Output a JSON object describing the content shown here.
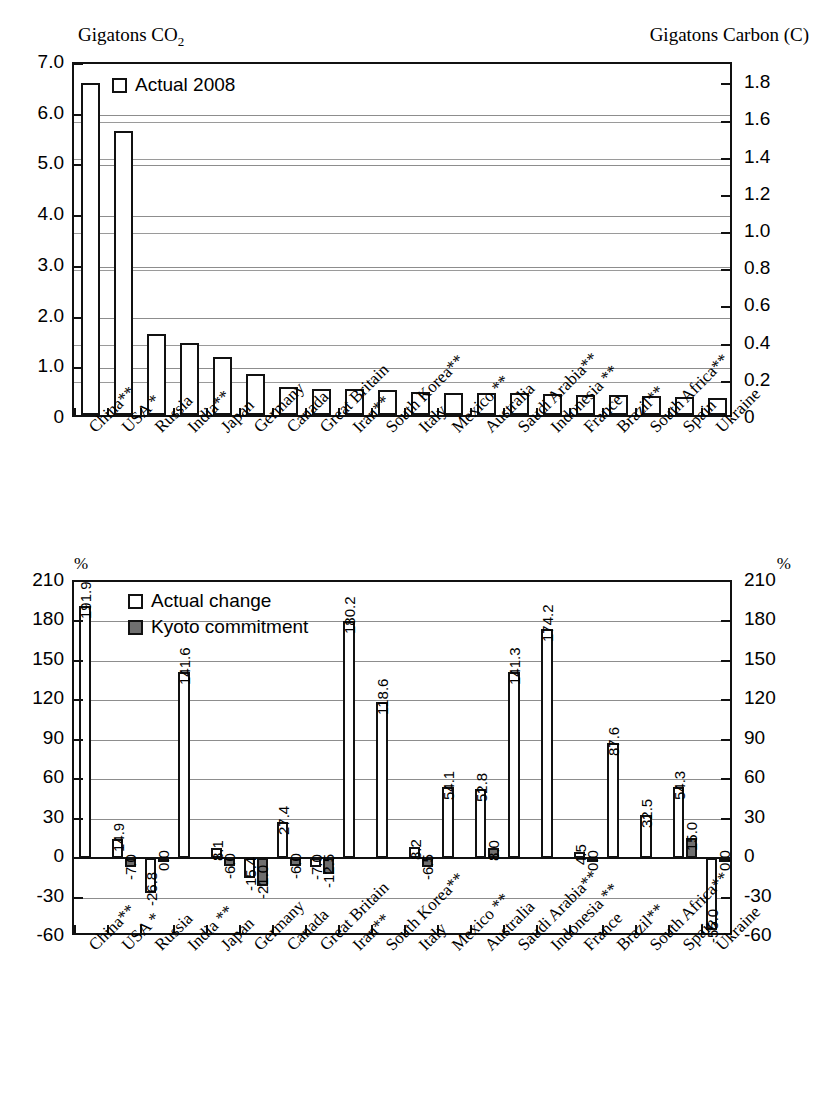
{
  "top_chart": {
    "left_axis_title": "Gigatons CO",
    "left_axis_title_sub": "2",
    "right_axis_title": "Gigatons Carbon (C)",
    "legend": [
      {
        "label": "Actual 2008",
        "style": "open"
      }
    ],
    "left_ticks": [
      "7.0",
      "6.0",
      "5.0",
      "4.0",
      "3.0",
      "2.0",
      "1.0",
      "0"
    ],
    "right_ticks": [
      "1.8",
      "1.6",
      "1.4",
      "1.2",
      "1.0",
      "0.8",
      "0.6",
      "0.4",
      "0.2",
      "0"
    ]
  },
  "bottom_chart": {
    "left_axis_title": "%",
    "right_axis_title": "%",
    "legend": [
      {
        "label": "Actual change",
        "style": "open"
      },
      {
        "label": "Kyoto commitment",
        "style": "filled"
      }
    ],
    "ticks": [
      "210",
      "180",
      "150",
      "120",
      "90",
      "60",
      "30",
      "0",
      "-30",
      "-60"
    ]
  },
  "chart_data": [
    {
      "type": "bar",
      "title": "Gigatons CO2",
      "xlabel": "",
      "ylabel": "Gigatons CO2",
      "ylabel_secondary": "Gigatons Carbon (C)",
      "ylim": [
        0,
        7.0
      ],
      "ylim_secondary": [
        0,
        1.909
      ],
      "grid": true,
      "legend_position": "top-left",
      "categories": [
        "China**",
        "USA *",
        "Russia",
        "India**",
        "Japan",
        "Germany",
        "Canada",
        "Great Britain",
        "Iran**",
        "South Korea**",
        "Italy",
        "Mexico **",
        "Australia",
        "Saudi Arabia**",
        "Indonesia **",
        "France",
        "Brazil**",
        "South Africa**",
        "Spain",
        "Ukraine"
      ],
      "series": [
        {
          "name": "Actual 2008",
          "values": [
            6.55,
            5.6,
            1.59,
            1.43,
            1.15,
            0.81,
            0.56,
            0.52,
            0.51,
            0.5,
            0.45,
            0.44,
            0.43,
            0.43,
            0.41,
            0.4,
            0.39,
            0.38,
            0.36,
            0.34
          ]
        }
      ]
    },
    {
      "type": "bar",
      "title": "",
      "xlabel": "",
      "ylabel": "%",
      "ylabel_secondary": "%",
      "ylim": [
        -60,
        210
      ],
      "grid": true,
      "legend_position": "top-left",
      "categories": [
        "China**",
        "USA *",
        "Russia",
        "India **",
        "Japan",
        "Germany",
        "Canada",
        "Great Britain",
        "Iran**",
        "South Korea**",
        "Italy",
        "Mexico **",
        "Australia",
        "Saudi Arabia**",
        "Indonesia **",
        "France",
        "Brazil**",
        "South Africa**",
        "Spain",
        "Ukraine"
      ],
      "series": [
        {
          "name": "Actual change",
          "values": [
            191.9,
            14.9,
            -26.8,
            141.6,
            8.1,
            -15.4,
            27.4,
            -7.0,
            180.2,
            118.6,
            8.2,
            54.1,
            52.8,
            141.3,
            174.2,
            4.5,
            87.6,
            32.5,
            54.3,
            -55.0
          ]
        },
        {
          "name": "Kyoto commitment",
          "values": [
            null,
            -7.0,
            0.0,
            null,
            -6.0,
            -21.0,
            -6.0,
            -12.5,
            null,
            null,
            -6.5,
            null,
            8.0,
            null,
            null,
            0.0,
            null,
            null,
            15.0,
            0.0
          ]
        }
      ],
      "labels": {
        "actual": [
          "191.9",
          "14.9",
          "-26.8",
          "141.6",
          "8.1",
          "-15.4",
          "27.4",
          "-7.0",
          "180.2",
          "118.6",
          "8.2",
          "54.1",
          "52.8",
          "141.3",
          "174.2",
          "4.5",
          "87.6",
          "32.5",
          "54.3",
          "-55.0"
        ],
        "kyoto": [
          "",
          "-7.0",
          "0.0",
          "",
          "-6.0",
          "-21.0",
          "-6.0",
          "-12.5",
          "",
          "",
          "-6.5",
          "",
          "8.0",
          "",
          "",
          "0.0",
          "",
          "",
          "15.0",
          "0.0"
        ]
      }
    }
  ]
}
